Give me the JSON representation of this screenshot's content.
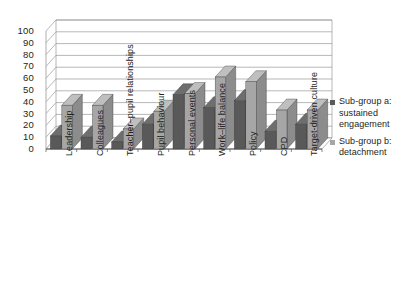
{
  "chart_data": {
    "type": "bar",
    "title": "",
    "subtitle": "",
    "xlabel": "",
    "ylabel": "",
    "ylim": [
      0,
      100
    ],
    "yticks": [
      0,
      10,
      20,
      30,
      40,
      50,
      60,
      70,
      80,
      90,
      100
    ],
    "ytick_labels": [
      "0",
      "10",
      "20",
      "30",
      "40",
      "50",
      "60",
      "70",
      "80",
      "90",
      "100"
    ],
    "grid": true,
    "legend_position": "right",
    "style": "3d-clustered-column",
    "categories": [
      "Leadership",
      "Colleagues",
      "Teacher–pupil relationships",
      "Pupil behaviour",
      "Personal events",
      "Work–life balance",
      "Policy",
      "CPD",
      "Target-driven culture"
    ],
    "series": [
      {
        "name": "Sub-group a: sustained engagement",
        "name_prefix": "Sub-group ",
        "name_italic": "a",
        "name_suffix": ": sustained engagement",
        "color": "#595959",
        "side_color": "#434343",
        "top_color": "#6e6e6e",
        "values": [
          11,
          10,
          6,
          21,
          46,
          35,
          41,
          15,
          21
        ]
      },
      {
        "name": "Sub-group b: detachment",
        "name_prefix": "Sub-group ",
        "name_italic": "b",
        "name_suffix": ": detachment",
        "color": "#a6a6a6",
        "side_color": "#8c8c8c",
        "top_color": "#bfbfbf",
        "values": [
          37,
          37,
          17,
          32,
          47,
          61,
          57,
          33,
          33
        ]
      }
    ]
  },
  "legend": {
    "entries": [
      {
        "label_line1": "Sub-group a:",
        "label_line2": "sustained",
        "label_line3": "engagement",
        "full": "Sub-group a: sustained engagement",
        "swatch_color": "#595959"
      },
      {
        "label_line1": "Sub-group b:",
        "label_line2": "detachment",
        "label_line3": "",
        "full": "Sub-group b: detachment",
        "swatch_color": "#a6a6a6"
      }
    ]
  },
  "colors": {
    "series_a": "#595959",
    "series_b": "#a6a6a6",
    "gridline": "#9a9a9a",
    "axis": "#808080",
    "text": "#231f20",
    "background": "#ffffff"
  }
}
